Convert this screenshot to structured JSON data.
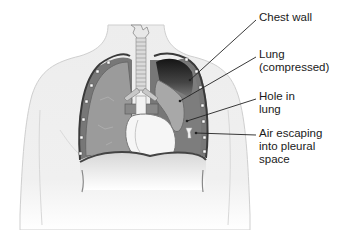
{
  "diagram": {
    "labels": [
      {
        "id": "chest-wall",
        "text": "Chest wall",
        "x": 259,
        "y": 11
      },
      {
        "id": "lung-compressed",
        "text": "Lung\n(compressed)",
        "x": 259,
        "y": 48
      },
      {
        "id": "hole-in-lung",
        "text": "Hole in\nlung",
        "x": 259,
        "y": 90
      },
      {
        "id": "air-escaping",
        "text": "Air escaping\ninto pleural\nspace",
        "x": 259,
        "y": 127
      }
    ],
    "colors": {
      "body": "#f0f0f0",
      "body_outline": "#c8c8c8",
      "lung": "#9a9a9a",
      "lung_dark": "#2a2a2a",
      "pleural_space": "#7a7a7a",
      "heart": "#f4f4f4",
      "chest_wall": "#4a4a4a",
      "pointer": "#222222"
    }
  }
}
